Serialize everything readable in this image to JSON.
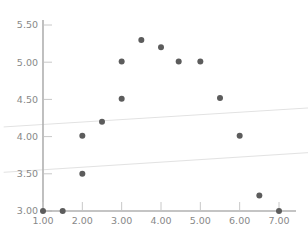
{
  "chart_data": {
    "type": "scatter",
    "title": "",
    "subtitle": "",
    "xlabel": "",
    "ylabel": "",
    "xlim": [
      1.0,
      7.0
    ],
    "ylim": [
      3.0,
      5.5
    ],
    "grid": false,
    "legend": null,
    "x_ticks": [
      1.0,
      2.0,
      3.0,
      4.0,
      5.0,
      6.0,
      7.0
    ],
    "x_tick_labels": [
      "1.00",
      "2.00",
      "3.00",
      "4.00",
      "5.00",
      "6.00",
      "7.00"
    ],
    "y_ticks": [
      3.0,
      3.5,
      4.0,
      4.5,
      5.0,
      5.5
    ],
    "y_tick_labels": [
      "3.00",
      "3.50",
      "4.00",
      "4.50",
      "5.00",
      "5.50"
    ],
    "series": [
      {
        "name": "points",
        "marker": "circle",
        "color": "#5c5c5c",
        "marker_size": 3.0,
        "points": [
          {
            "x": 1.0,
            "y": 3.0
          },
          {
            "x": 1.5,
            "y": 3.0
          },
          {
            "x": 2.0,
            "y": 3.5
          },
          {
            "x": 2.0,
            "y": 4.01
          },
          {
            "x": 2.5,
            "y": 4.2
          },
          {
            "x": 3.0,
            "y": 4.51
          },
          {
            "x": 3.0,
            "y": 5.01
          },
          {
            "x": 3.5,
            "y": 5.3
          },
          {
            "x": 4.0,
            "y": 5.2
          },
          {
            "x": 4.45,
            "y": 5.01
          },
          {
            "x": 5.0,
            "y": 5.01
          },
          {
            "x": 5.5,
            "y": 4.52
          },
          {
            "x": 6.0,
            "y": 4.01
          },
          {
            "x": 6.5,
            "y": 3.21
          },
          {
            "x": 7.0,
            "y": 3.0
          }
        ]
      }
    ],
    "reference_lines": [
      {
        "name": "upper-band-line",
        "color": "#e2e2e2",
        "x_start": 0.0,
        "y_start": 4.13,
        "x_end": 8.2,
        "y_end": 4.4
      },
      {
        "name": "lower-band-line",
        "color": "#e2e2e2",
        "x_start": 0.0,
        "y_start": 3.52,
        "x_end": 8.2,
        "y_end": 3.8
      }
    ],
    "axis_color": "#b0b0b0",
    "tick_color": "#c8c8c8",
    "label_color": "#888888",
    "background_color": "#ffffff"
  }
}
